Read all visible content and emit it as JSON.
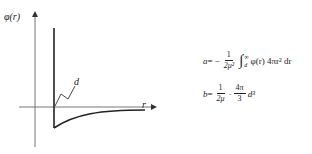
{
  "diagram": {
    "type": "potential-curve",
    "y_axis_label": "φ(r)",
    "x_axis_label": "r",
    "marker_label": "d",
    "curve_description": "hard-core at r=d (vertical wall), then attractive well rising asymptotically to zero"
  },
  "equations": {
    "a": {
      "lhs": "a",
      "equals": "=",
      "sign": "−",
      "frac_num": "1",
      "frac_den": "2μ²",
      "integral_upper": "∞",
      "integral_lower": "d",
      "integrand": "φ(r) 4πr² dr"
    },
    "b": {
      "lhs": "b",
      "equals": "=",
      "frac1_num": "1",
      "frac1_den": "2μ",
      "dot": "·",
      "frac2_num": "4π",
      "frac2_den": "3",
      "tail": "d³"
    }
  }
}
